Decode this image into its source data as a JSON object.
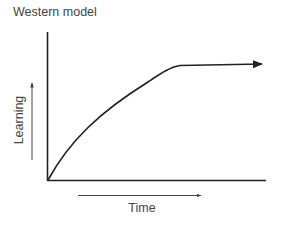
{
  "diagram": {
    "title": "Western model",
    "x_label": "Time",
    "y_label": "Learning",
    "colors": {
      "stroke": "#222222",
      "text": "#444444",
      "background": "#ffffff"
    },
    "curve_description": "Learning rises steeply from origin, decelerates, then plateaus and continues flat with an arrowhead"
  }
}
